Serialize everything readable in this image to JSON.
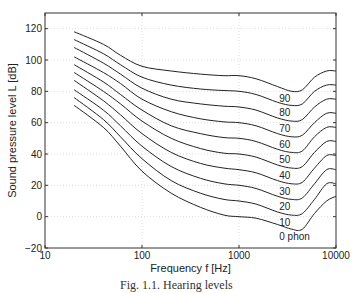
{
  "chart_data": {
    "type": "line",
    "title": "",
    "xlabel": "Frequency f [Hz]",
    "ylabel": "Sound pressure level L [dB]",
    "xscale": "log",
    "xlim": [
      10,
      10000
    ],
    "ylim": [
      -20,
      130
    ],
    "xticks": [
      10,
      100,
      1000,
      10000
    ],
    "xtick_labels": [
      "10",
      "100",
      "1000",
      "10000"
    ],
    "yticks": [
      -20,
      0,
      20,
      40,
      60,
      80,
      100,
      120
    ],
    "ytick_labels": [
      "−20",
      "0",
      "20",
      "40",
      "60",
      "80",
      "100",
      "120"
    ],
    "grid": true,
    "x": [
      20,
      40,
      60,
      100,
      200,
      400,
      700,
      1000,
      1500,
      2500,
      3500,
      4500,
      6000,
      8000,
      10000
    ],
    "series": [
      {
        "name": "90",
        "label": "90",
        "values": [
          118,
          110,
          103,
          96,
          93,
          91,
          90,
          90,
          88,
          83,
          80,
          81,
          89,
          93,
          93
        ]
      },
      {
        "name": "80",
        "label": "80",
        "values": [
          113,
          104,
          97,
          89,
          84,
          81.5,
          80.5,
          80,
          78,
          73,
          71,
          72,
          80,
          84,
          84
        ]
      },
      {
        "name": "70",
        "label": "70",
        "values": [
          108,
          98,
          91,
          82,
          75,
          72,
          70.5,
          70,
          68,
          63,
          61,
          62,
          70,
          75,
          75
        ]
      },
      {
        "name": "60",
        "label": "60",
        "values": [
          102,
          92,
          85,
          75,
          67,
          62.5,
          60.5,
          60,
          58,
          53,
          51,
          52,
          60,
          66,
          66
        ]
      },
      {
        "name": "50",
        "label": "50",
        "values": [
          97,
          86,
          78,
          68,
          58,
          53,
          50.5,
          50,
          48,
          43,
          41,
          42,
          51,
          57,
          57
        ]
      },
      {
        "name": "40",
        "label": "40",
        "values": [
          92,
          80,
          72,
          61,
          50,
          43.5,
          40.5,
          40,
          38,
          33,
          31,
          32,
          41,
          48,
          48
        ]
      },
      {
        "name": "30",
        "label": "30",
        "values": [
          87,
          74,
          65,
          53,
          41,
          34,
          31,
          30,
          28,
          23,
          21,
          22,
          31,
          39,
          39
        ]
      },
      {
        "name": "20",
        "label": "20",
        "values": [
          81,
          68,
          58,
          45,
          32,
          24.5,
          21,
          20,
          18,
          13,
          11,
          12,
          21,
          30,
          30
        ]
      },
      {
        "name": "10",
        "label": "10",
        "values": [
          76,
          62,
          51,
          37,
          23,
          15,
          11,
          10,
          8,
          3,
          1,
          2,
          11,
          21,
          21
        ]
      },
      {
        "name": "0",
        "label": "0 phon",
        "values": [
          71,
          57,
          45,
          29,
          15,
          6,
          1,
          0,
          -1,
          -5,
          -8,
          -8,
          2,
          10,
          13
        ]
      }
    ],
    "annotations": [
      "90",
      "80",
      "70",
      "60",
      "50",
      "40",
      "30",
      "20",
      "10",
      "0 phon"
    ],
    "legend": "none"
  },
  "caption": "Fig. 1.1. Hearing levels"
}
